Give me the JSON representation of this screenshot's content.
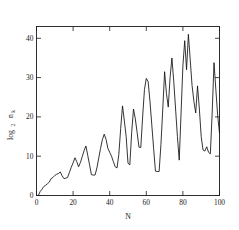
{
  "chart_data": {
    "type": "line",
    "title": "",
    "xlabel": "N",
    "ylabel": "log2 n_k",
    "ylabel_main": "log",
    "ylabel_sub": "2",
    "ylabel_var": "n",
    "ylabel_var_sub": "k",
    "xlim": [
      0,
      100
    ],
    "ylim": [
      0,
      43
    ],
    "xticks": [
      0,
      20,
      40,
      60,
      80,
      100
    ],
    "yticks": [
      0,
      10,
      20,
      30,
      40
    ],
    "xtick_labels": [
      "0",
      "20",
      "40",
      "60",
      "80",
      "100"
    ],
    "ytick_labels": [
      "0",
      "10",
      "20",
      "30",
      "40"
    ],
    "grid": false,
    "legend": false,
    "frame": "box",
    "line_color": "#111111",
    "background_color": "#ffffff",
    "x": [
      1,
      2,
      3,
      4,
      5,
      6,
      7,
      8,
      9,
      10,
      11,
      12,
      13,
      14,
      15,
      16,
      17,
      18,
      19,
      20,
      21,
      22,
      23,
      24,
      25,
      26,
      27,
      28,
      29,
      30,
      31,
      32,
      33,
      34,
      35,
      36,
      37,
      38,
      39,
      40,
      41,
      42,
      43,
      44,
      45,
      46,
      47,
      48,
      49,
      50,
      51,
      52,
      53,
      54,
      55,
      56,
      57,
      58,
      59,
      60,
      61,
      62,
      63,
      64,
      65,
      66,
      67,
      68,
      69,
      70,
      71,
      72,
      73,
      74,
      75,
      76,
      77,
      78,
      79,
      80,
      81,
      82,
      83,
      84,
      85,
      86,
      87,
      88,
      89,
      90,
      91,
      92,
      93,
      94,
      95,
      96,
      97,
      98,
      99,
      100
    ],
    "y": [
      0.0,
      1.0,
      1.6,
      2.3,
      2.6,
      3.0,
      3.4,
      4.3,
      4.6,
      5.1,
      5.4,
      5.6,
      6.0,
      5.0,
      4.3,
      4.4,
      4.6,
      5.9,
      7.2,
      8.3,
      9.6,
      8.6,
      7.3,
      8.4,
      9.9,
      11.4,
      12.6,
      10.2,
      7.8,
      5.3,
      5.2,
      5.2,
      7.0,
      9.5,
      12.0,
      14.2,
      15.6,
      14.3,
      12.0,
      11.0,
      10.0,
      8.6,
      7.3,
      7.0,
      10.5,
      17.0,
      22.8,
      19.0,
      15.0,
      8.2,
      7.8,
      16.0,
      22.0,
      19.5,
      16.0,
      12.3,
      12.2,
      20.0,
      27.0,
      29.8,
      29.0,
      24.0,
      18.0,
      12.0,
      6.2,
      6.1,
      6.1,
      13.0,
      22.0,
      31.5,
      26.0,
      22.5,
      30.0,
      35.0,
      29.0,
      22.0,
      15.0,
      9.0,
      21.0,
      33.0,
      39.4,
      32.0,
      41.0,
      34.5,
      28.0,
      24.0,
      21.0,
      27.9,
      22.0,
      15.0,
      11.6,
      11.3,
      12.4,
      11.0,
      10.6,
      21.0,
      33.8,
      27.0,
      20.4,
      15.8
    ]
  },
  "figure": {
    "dimensions": "239x230"
  }
}
